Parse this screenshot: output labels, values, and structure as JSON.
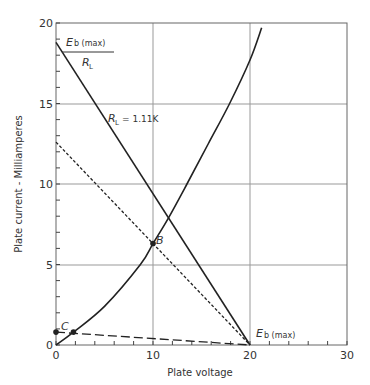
{
  "chart_data": {
    "type": "line",
    "title": "",
    "xlabel": "Plate voltage",
    "ylabel": "Plate current - Milliamperes",
    "xlim": [
      0,
      30
    ],
    "ylim": [
      0,
      20
    ],
    "x_ticks": [
      0,
      10,
      20,
      30
    ],
    "y_ticks": [
      0,
      5,
      10,
      15,
      20
    ],
    "x_minor_step": 2,
    "y_minor_step": 1,
    "grid": true,
    "series": [
      {
        "name": "Plate characteristic curve",
        "style": "solid",
        "x": [
          0,
          1.8,
          5,
          8.7,
          10,
          11.6,
          13.5,
          15.7,
          17.9,
          20,
          21.2
        ],
        "y": [
          0,
          0.8,
          2.4,
          5,
          6.3,
          7.9,
          10,
          12.5,
          15,
          17.7,
          19.7
        ]
      },
      {
        "name": "Load line RL = 1.11K",
        "style": "solid",
        "x": [
          0,
          20
        ],
        "y": [
          18.8,
          0
        ]
      },
      {
        "name": "Load line (dotted)",
        "style": "dotted",
        "x": [
          0,
          20
        ],
        "y": [
          12.6,
          0
        ]
      },
      {
        "name": "Load line (dashed)",
        "style": "dashed",
        "x": [
          0,
          20
        ],
        "y": [
          0.8,
          0
        ]
      }
    ],
    "points": [
      {
        "label": "B",
        "x": 10,
        "y": 6.3
      },
      {
        "label": "C",
        "x": 0,
        "y": 0.8
      },
      {
        "label": "",
        "x": 1.8,
        "y": 0.8
      }
    ],
    "annotations": [
      {
        "text": "Eb (max) / RL",
        "x": 0,
        "y": 18.8
      },
      {
        "text": "RL = 1.11K",
        "x": 7,
        "y": 13.4
      },
      {
        "text": "Eb (max)",
        "x": 20,
        "y": 0
      }
    ]
  },
  "labels": {
    "xlabel": "Plate voltage",
    "ylabel": "Plate current - Milliamperes",
    "eb_max_top": "E",
    "eb_max_top_sub": "b (max)",
    "rl_den": "R",
    "rl_den_sub": "L",
    "rl_value_R": "R",
    "rl_value_sub": "L",
    "rl_value_text": "= 1.11K",
    "point_b": "B",
    "point_c": "C",
    "eb_max_bottom": "E",
    "eb_max_bottom_sub": "b (max)",
    "ticks_x": [
      "0",
      "10",
      "20",
      "30"
    ],
    "ticks_y": [
      "0",
      "5",
      "10",
      "15",
      "20"
    ]
  },
  "colors": {
    "line": "#222222",
    "grid": "#999999",
    "text": "#333333"
  }
}
